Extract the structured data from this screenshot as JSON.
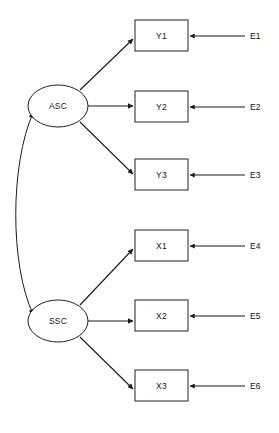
{
  "diagram": {
    "type": "sem-path-diagram",
    "title": "",
    "background_color": "#ffffff",
    "line_color": "#1a1a1a",
    "text_color": "#141414",
    "latent_variables": [
      {
        "id": "ASC",
        "label": "ASC",
        "shape": "ellipse",
        "cx": 58,
        "cy": 106,
        "rx": 30,
        "ry": 21
      },
      {
        "id": "SSC",
        "label": "SSC",
        "shape": "ellipse",
        "cx": 58,
        "cy": 321,
        "rx": 30,
        "ry": 21
      }
    ],
    "indicators": [
      {
        "id": "Y1",
        "label": "Y1",
        "shape": "rect",
        "x": 135,
        "y": 20,
        "width": 53,
        "height": 31,
        "loading_from": "ASC",
        "residual": "E1"
      },
      {
        "id": "Y2",
        "label": "Y2",
        "shape": "rect",
        "x": 135,
        "y": 91,
        "width": 53,
        "height": 31,
        "loading_from": "ASC",
        "residual": "E2"
      },
      {
        "id": "Y3",
        "label": "Y3",
        "shape": "rect",
        "x": 135,
        "y": 159,
        "width": 53,
        "height": 31,
        "loading_from": "ASC",
        "residual": "E3"
      },
      {
        "id": "X1",
        "label": "X1",
        "shape": "rect",
        "x": 135,
        "y": 230,
        "width": 53,
        "height": 31,
        "loading_from": "SSC",
        "residual": "E4"
      },
      {
        "id": "X2",
        "label": "X2",
        "shape": "rect",
        "x": 135,
        "y": 300,
        "width": 53,
        "height": 31,
        "loading_from": "SSC",
        "residual": "E5"
      },
      {
        "id": "X3",
        "label": "X3",
        "shape": "rect",
        "x": 135,
        "y": 370,
        "width": 53,
        "height": 31,
        "loading_from": "SSC",
        "residual": "E6"
      }
    ],
    "residuals": [
      {
        "id": "E1",
        "label": "E1",
        "x": 250,
        "y": 36,
        "line_start_x": 245,
        "target": "Y1"
      },
      {
        "id": "E2",
        "label": "E2",
        "x": 250,
        "y": 107,
        "line_start_x": 245,
        "target": "Y2"
      },
      {
        "id": "E3",
        "label": "E3",
        "x": 250,
        "y": 175,
        "line_start_x": 245,
        "target": "Y3"
      },
      {
        "id": "E4",
        "label": "E4",
        "x": 250,
        "y": 246,
        "line_start_x": 245,
        "target": "X1"
      },
      {
        "id": "E5",
        "label": "E5",
        "x": 250,
        "y": 316,
        "line_start_x": 245,
        "target": "X2"
      },
      {
        "id": "E6",
        "label": "E6",
        "x": 250,
        "y": 386,
        "line_start_x": 245,
        "target": "X3"
      }
    ],
    "covariance": {
      "from": "ASC",
      "to": "SSC",
      "style": "double-headed-curve",
      "label": ""
    }
  }
}
